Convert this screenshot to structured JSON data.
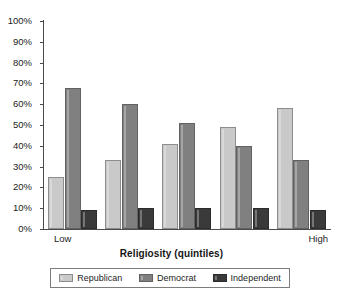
{
  "chart_data": {
    "type": "bar",
    "title": "",
    "subtitle": "",
    "xlabel": "Religiosity (quintiles)",
    "ylabel": "",
    "categories": [
      "1",
      "2",
      "3",
      "4",
      "5"
    ],
    "x_tick_labels": [
      "Low",
      "High"
    ],
    "ylim": [
      0,
      100
    ],
    "y_tick_labels": [
      "100%",
      "90%",
      "80%",
      "70%",
      "60%",
      "50%",
      "40%",
      "30%",
      "20%",
      "10%",
      "0%"
    ],
    "y_tick_values": [
      100,
      90,
      80,
      70,
      60,
      50,
      40,
      30,
      20,
      10,
      0
    ],
    "grid": false,
    "legend_position": "bottom",
    "value_unit": "%",
    "series": [
      {
        "name": "Republican",
        "color": "#c9c9c9",
        "values": [
          25,
          33,
          41,
          49,
          58
        ]
      },
      {
        "name": "Democrat",
        "color": "#808080",
        "values": [
          68,
          60,
          51,
          40,
          33
        ]
      },
      {
        "name": "Independent",
        "color": "#3a3a3a",
        "values": [
          9,
          10,
          10,
          10,
          9
        ]
      }
    ]
  },
  "axis": {
    "x_title": "Religiosity (quintiles)",
    "x_low_label": "Low",
    "x_high_label": "High"
  },
  "legend": {
    "items": [
      {
        "label": "Republican",
        "color": "#c9c9c9",
        "swatch": "legend-swatch-republican"
      },
      {
        "label": "Democrat",
        "color": "#808080",
        "swatch": "legend-swatch-democrat"
      },
      {
        "label": "Independent",
        "color": "#3a3a3a",
        "swatch": "legend-swatch-independent"
      }
    ]
  }
}
